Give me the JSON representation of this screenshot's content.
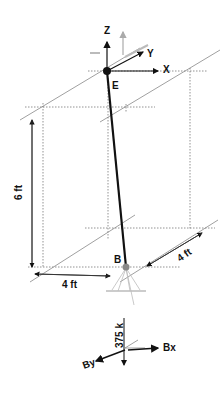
{
  "diagram": {
    "points": {
      "E": {
        "label": "E"
      },
      "B": {
        "label": "B"
      }
    },
    "axes": {
      "x": "X",
      "y": "Y",
      "z": "Z"
    },
    "dimensions": {
      "height": "6 ft",
      "width_x": "4 ft",
      "depth_y": "4 ft"
    },
    "reactions": {
      "vertical_load": "375 k",
      "bx": "Bx",
      "by": "By"
    },
    "colors": {
      "member": "#111111",
      "dotted_grid": "#777777",
      "gray_arrow": "#aaaaaa"
    }
  }
}
